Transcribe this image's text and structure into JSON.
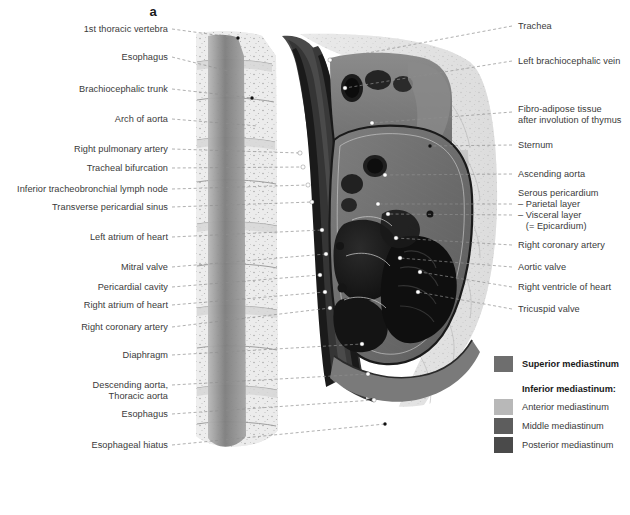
{
  "figure": {
    "panel_letter": "a",
    "type": "anatomical-illustration"
  },
  "labels_left": [
    {
      "text": "1st thoracic vertebra",
      "y": 30,
      "anchor_x": 238,
      "anchor_y": 38
    },
    {
      "text": "Esophagus",
      "y": 58,
      "anchor_x": 232,
      "anchor_y": 72
    },
    {
      "text": "Brachiocephalic trunk",
      "y": 90,
      "anchor_x": 252,
      "anchor_y": 98
    },
    {
      "text": "Right pulmonary artery",
      "y": 150,
      "anchor_x": 300,
      "anchor_y": 153
    },
    {
      "text": "Arch of aorta",
      "y": 120,
      "anchor_x": 258,
      "anchor_y": 126
    },
    {
      "text": "Tracheal bifurcation",
      "y": 169,
      "anchor_x": 303,
      "anchor_y": 167
    },
    {
      "text": "Inferior tracheobronchial lymph node",
      "y": 190,
      "anchor_x": 308,
      "anchor_y": 185
    },
    {
      "text": "Transverse pericardial sinus",
      "y": 208,
      "anchor_x": 312,
      "anchor_y": 202
    },
    {
      "text": "Left atrium of heart",
      "y": 238,
      "anchor_x": 322,
      "anchor_y": 230
    },
    {
      "text": "Mitral valve",
      "y": 268,
      "anchor_x": 326,
      "anchor_y": 254
    },
    {
      "text": "Pericardial cavity",
      "y": 288,
      "anchor_x": 320,
      "anchor_y": 275
    },
    {
      "text": "Right atrium of heart",
      "y": 306,
      "anchor_x": 325,
      "anchor_y": 292
    },
    {
      "text": "Right coronary artery",
      "y": 328,
      "anchor_x": 330,
      "anchor_y": 308
    },
    {
      "text": "Diaphragm",
      "y": 356,
      "anchor_x": 362,
      "anchor_y": 344
    },
    {
      "text": "Descending aorta,",
      "y": 386,
      "anchor_x": 368,
      "anchor_y": 374
    },
    {
      "text": "Thoracic aorta",
      "y": 397,
      "anchor_x": null,
      "anchor_y": null
    },
    {
      "text": "Esophagus",
      "y": 415,
      "anchor_x": 374,
      "anchor_y": 400
    },
    {
      "text": "Esophageal hiatus",
      "y": 446,
      "anchor_x": 385,
      "anchor_y": 424
    }
  ],
  "labels_right": [
    {
      "text": "Trachea",
      "y": 27,
      "anchor_x": 330,
      "anchor_y": 60
    },
    {
      "text": "Left brachiocephalic vein",
      "y": 62,
      "anchor_x": 345,
      "anchor_y": 88
    },
    {
      "text": "Fibro-adipose tissue",
      "y": 110,
      "anchor_x": 372,
      "anchor_y": 123
    },
    {
      "text": "after involution of thymus",
      "y": 121,
      "anchor_x": null,
      "anchor_y": null
    },
    {
      "text": "Sternum",
      "y": 146,
      "anchor_x": 430,
      "anchor_y": 146
    },
    {
      "text": "Ascending aorta",
      "y": 175,
      "anchor_x": 385,
      "anchor_y": 175
    },
    {
      "text": "Serous pericardium",
      "y": 194,
      "anchor_x": null,
      "anchor_y": null
    },
    {
      "text": "– Parietal layer",
      "y": 205,
      "anchor_x": 378,
      "anchor_y": 204
    },
    {
      "text": "– Visceral layer",
      "y": 216,
      "anchor_x": 388,
      "anchor_y": 214
    },
    {
      "text": "   (= Epicardium)",
      "y": 227,
      "anchor_x": null,
      "anchor_y": null
    },
    {
      "text": "Right coronary artery",
      "y": 246,
      "anchor_x": 396,
      "anchor_y": 238
    },
    {
      "text": "Aortic valve",
      "y": 268,
      "anchor_x": 400,
      "anchor_y": 258
    },
    {
      "text": "Right ventricle of heart",
      "y": 288,
      "anchor_x": 420,
      "anchor_y": 272
    },
    {
      "text": "Tricuspid valve",
      "y": 310,
      "anchor_x": 418,
      "anchor_y": 292
    }
  ],
  "legend": {
    "superior": {
      "label": "Superior mediastinum",
      "color": "#6e6e6e"
    },
    "inferior_heading": "Inferior mediastinum:",
    "inferior_items": [
      {
        "label": "Anterior mediastinum",
        "color": "#b8b8b8"
      },
      {
        "label": "Middle mediastinum",
        "color": "#5d5d5d"
      },
      {
        "label": "Posterior mediastinum",
        "color": "#4a4a4a"
      }
    ]
  },
  "colors": {
    "background": "#ffffff",
    "label_text": "#3a3a3a",
    "leader_line": "#8e8e8e",
    "bone_light": "#ececec",
    "soft_tissue": "#9a9a9a",
    "lumen_dark": "#1d1d1d",
    "muscle_mid": "#6b6b6b"
  }
}
